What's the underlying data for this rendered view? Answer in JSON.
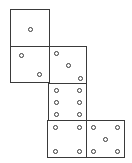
{
  "diagram": {
    "type": "cube-net",
    "line_color": "#3a3a3a",
    "background": "#ffffff",
    "faces": [
      {
        "id": "face-1",
        "value": 1,
        "x": 10,
        "y": 9,
        "w": 40,
        "h": 38,
        "pips": [
          [
            19,
            19
          ]
        ]
      },
      {
        "id": "face-2",
        "value": 2,
        "x": 10,
        "y": 46,
        "w": 40,
        "h": 37,
        "pips": [
          [
            10,
            8
          ],
          [
            28,
            27
          ]
        ]
      },
      {
        "id": "face-3",
        "value": 3,
        "x": 49,
        "y": 46,
        "w": 38,
        "h": 38,
        "pips": [
          [
            6,
            6
          ],
          [
            18,
            18
          ],
          [
            30,
            31
          ]
        ]
      },
      {
        "id": "face-6",
        "value": 6,
        "x": 48,
        "y": 83,
        "w": 39,
        "h": 38,
        "pips": [
          [
            7,
            6
          ],
          [
            30,
            6
          ],
          [
            7,
            18
          ],
          [
            30,
            18
          ],
          [
            7,
            30
          ],
          [
            30,
            30
          ]
        ]
      },
      {
        "id": "face-4",
        "value": 4,
        "x": 47,
        "y": 120,
        "w": 40,
        "h": 38,
        "pips": [
          [
            7,
            6
          ],
          [
            31,
            6
          ],
          [
            7,
            30
          ],
          [
            31,
            30
          ]
        ]
      },
      {
        "id": "face-5",
        "value": 5,
        "x": 86,
        "y": 120,
        "w": 39,
        "h": 38,
        "pips": [
          [
            6,
            6
          ],
          [
            30,
            6
          ],
          [
            18,
            18
          ],
          [
            6,
            30
          ],
          [
            30,
            30
          ]
        ]
      }
    ]
  }
}
